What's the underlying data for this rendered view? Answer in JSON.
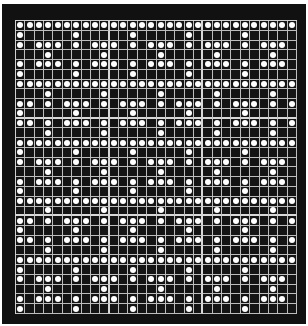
{
  "figure": {
    "rows": 30,
    "cols": 30,
    "colors": {
      "background": "#111111",
      "grid_line": "#bdbdbd",
      "dot": "#ffffff",
      "page": "#ffffff"
    },
    "legend": {
      "filled": "●",
      "empty": "."
    },
    "grid": [
      "●●●●●●●●●●●●●●●●●●●●●●●●●●●●●●",
      "●.....●.....●.....●.....●.....",
      "●.●●●.●.●●●.●.●●●.●.●●●.●.●●●.",
      "...●.....●.....●.....●.....●..",
      "●.●●●.●.●●●.●.●●●.●.●●●.●.●●●.",
      "●.....●.....●.....●.....●.....",
      "●●●●●●●●●●●●●●●●●●●●●●●●●●●●●●",
      "...●.....●.....●.....●.....●..",
      "●●.●.●●●.●.●●●.●.●●●.●.●●●.●.●",
      "●.....●.....●.....●.....●.....",
      "●●.●.●●●.●.●●●.●.●●●.●.●●●.●.●",
      "...●.....●.....●.....●.....●..",
      "●●●●●●●●●●●●●●●●●●●●●●●●●●●●●●",
      "●.....●.....●.....●.....●.....",
      "●.●●●.●.●●●.●.●●●.●.●●●.●.●●●.",
      "...●.....●.....●.....●.....●..",
      "●.●●●.●.●●●.●.●●●.●.●●●.●.●●●.",
      "●.....●.....●.....●.....●.....",
      "●●●●●●●●●●●●●●●●●●●●●●●●●●●●●●",
      "...●.....●.....●.....●.....●..",
      "●●.●.●●●.●.●●●.●.●●●.●.●●●.●.●",
      "●.....●.....●.....●.....●.....",
      "●●.●.●●●.●.●●●.●.●●●.●.●●●.●.●",
      "...●.....●.....●.....●.....●..",
      "●●●●●●●●●●●●●●●●●●●●●●●●●●●●●●",
      "●.....●.....●.....●.....●.....",
      "●.●●●.●.●●●.●.●●●.●.●●●.●.●●●.",
      "...●.....●.....●.....●.....●..",
      "●.●●●.●.●●●.●.●●●.●.●●●.●.●●●.",
      "●.....●.....●.....●.....●....."
    ],
    "block_divider_cols": [
      10,
      20
    ],
    "block_divider_rows": [
      10,
      20
    ]
  }
}
